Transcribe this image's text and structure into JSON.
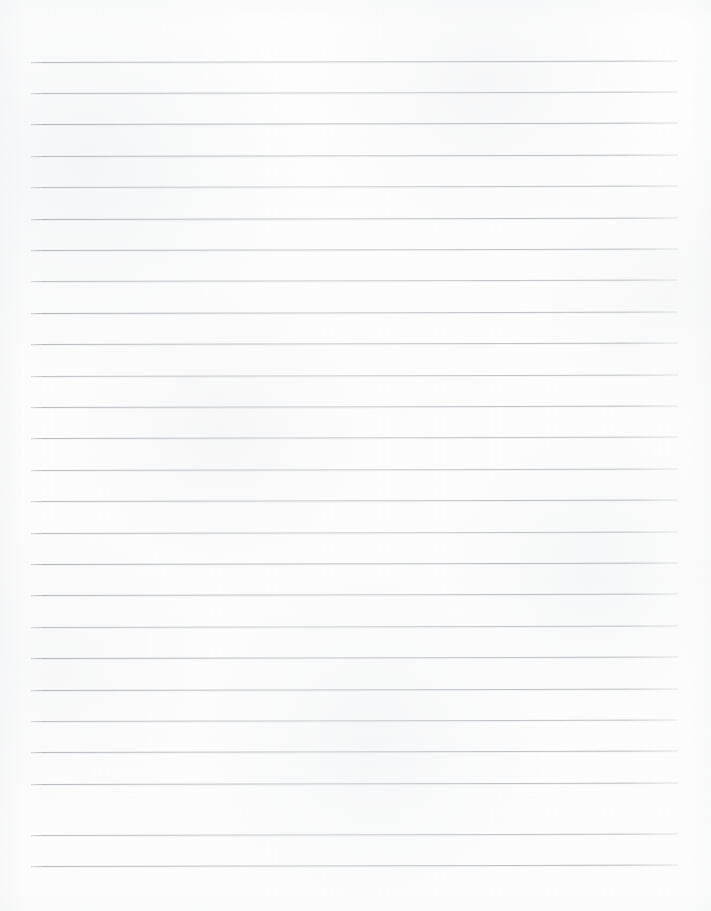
{
  "document": {
    "kind": "scanned-lined-paper",
    "title": "Blank Ruled Notebook Page",
    "page_width": 711,
    "page_height": 911,
    "orientation": "portrait",
    "visible_text": "",
    "handwriting": "none",
    "colors": {
      "paper": "#fdfdfd",
      "rule_line": "#aeb2b8",
      "rule_line_light": "#c6c9cd",
      "page_edge_shadow": "#eceef0"
    }
  },
  "ruling": {
    "style": "wide-ruled-horizontal",
    "line_count": 26,
    "first_line_y": 61.5,
    "line_spacing": 31.4,
    "line_left_x": 31,
    "line_right_x": 678,
    "line_thickness": 1,
    "slope_px": -1.5,
    "margin_line": "none",
    "binder_holes": "none",
    "header_zone_height": 61,
    "footer_zone_height": 45,
    "lines": [
      {
        "index": 1,
        "y": 61.5,
        "x1": 31,
        "x2": 678
      },
      {
        "index": 2,
        "y": 92.9,
        "x1": 31,
        "x2": 678
      },
      {
        "index": 3,
        "y": 124.3,
        "x1": 31,
        "x2": 678
      },
      {
        "index": 4,
        "y": 155.7,
        "x1": 31,
        "x2": 678
      },
      {
        "index": 5,
        "y": 187.1,
        "x1": 31,
        "x2": 678
      },
      {
        "index": 6,
        "y": 218.5,
        "x1": 31,
        "x2": 678
      },
      {
        "index": 7,
        "y": 249.9,
        "x1": 31,
        "x2": 678
      },
      {
        "index": 8,
        "y": 281.3,
        "x1": 31,
        "x2": 678
      },
      {
        "index": 9,
        "y": 312.7,
        "x1": 31,
        "x2": 678
      },
      {
        "index": 10,
        "y": 344.1,
        "x1": 31,
        "x2": 678
      },
      {
        "index": 11,
        "y": 375.5,
        "x1": 31,
        "x2": 678
      },
      {
        "index": 12,
        "y": 406.9,
        "x1": 31,
        "x2": 678
      },
      {
        "index": 13,
        "y": 438.3,
        "x1": 31,
        "x2": 678
      },
      {
        "index": 14,
        "y": 469.7,
        "x1": 31,
        "x2": 678
      },
      {
        "index": 15,
        "y": 501.1,
        "x1": 31,
        "x2": 678
      },
      {
        "index": 16,
        "y": 532.5,
        "x1": 31,
        "x2": 678
      },
      {
        "index": 17,
        "y": 563.9,
        "x1": 31,
        "x2": 678
      },
      {
        "index": 18,
        "y": 595.3,
        "x1": 31,
        "x2": 678
      },
      {
        "index": 19,
        "y": 626.7,
        "x1": 31,
        "x2": 678
      },
      {
        "index": 20,
        "y": 658.1,
        "x1": 31,
        "x2": 678
      },
      {
        "index": 21,
        "y": 689.5,
        "x1": 31,
        "x2": 678
      },
      {
        "index": 22,
        "y": 720.9,
        "x1": 31,
        "x2": 678
      },
      {
        "index": 23,
        "y": 752.3,
        "x1": 31,
        "x2": 678
      },
      {
        "index": 24,
        "y": 783.7,
        "x1": 31,
        "x2": 678
      },
      {
        "index": 25,
        "y": 834.6,
        "x1": 31,
        "x2": 678
      },
      {
        "index": 26,
        "y": 866.0,
        "x1": 31,
        "x2": 678
      }
    ]
  }
}
